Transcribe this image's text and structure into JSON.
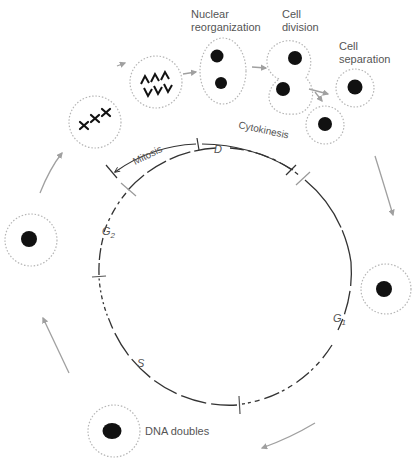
{
  "colors": {
    "cell_outline": "#b5b5b5",
    "nucleus": "#111111",
    "cycle_line": "#333333",
    "arrow": "#a0a0a0",
    "text": "#555555"
  },
  "stages": {
    "nuclear_reorganization": [
      "Nuclear",
      "reorganization"
    ],
    "cell_division": [
      "Cell",
      "division"
    ],
    "cell_separation": [
      "Cell",
      "separation"
    ],
    "dna_doubles": "DNA doubles"
  },
  "phase_labels": {
    "mitosis": "Mitosis",
    "cytokinesis": "Cytokinesis",
    "d": "D",
    "g1": "G",
    "g1_sub": "1",
    "g2": "G",
    "g2_sub": "2",
    "s": "S"
  },
  "chromosome_glyphs": {
    "metaphase": "✖✖✖",
    "anaphase_top": "ʌʌʌ",
    "anaphase_bottom": "vvv"
  }
}
